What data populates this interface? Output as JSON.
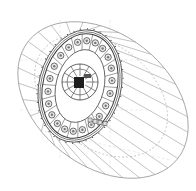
{
  "diagram": {
    "type": "technical-line-drawing",
    "colors": {
      "background": "#ffffff",
      "line": "#3a3a3a",
      "light_line": "#9a9a9a",
      "dark_fill": "#1e1e1e"
    },
    "outer_ring": {
      "cx": 103,
      "cy": 100,
      "rx": 95,
      "ry": 66,
      "rotation": 38,
      "spoke_count": 30
    },
    "inner_body": {
      "cx": 80,
      "cy": 86,
      "rx": 37,
      "ry": 53,
      "rotation": 14,
      "hole_count": 22
    },
    "hub": {
      "cx": 80,
      "cy": 82,
      "r": 18,
      "sector_count": 12
    }
  }
}
